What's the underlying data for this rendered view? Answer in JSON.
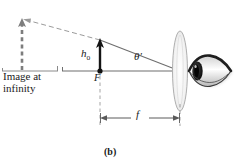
{
  "figure": {
    "part_label": "(b)",
    "labels": {
      "image_line1": "Image at",
      "image_line2": "infinity",
      "object_height": "h",
      "object_height_sub": "o",
      "focal_point": "F",
      "angle": "θ′",
      "focal_length": "f"
    },
    "colors": {
      "ink": "#1a1a1a",
      "ray": "#6e6e6e",
      "dashed": "#8a8a8a",
      "lens": "#b5b5b5",
      "eye_dark": "#2b2b2b",
      "background": "#ffffff"
    },
    "geometry": {
      "axis_y": 71,
      "axis_x_start": 62,
      "axis_x_end": 180,
      "object_x": 100,
      "object_top_y": 40,
      "lens_x": 180,
      "lens_ry": 40,
      "lens_rx": 7,
      "virtual_object_x": 22,
      "virtual_object_top_y": 19,
      "focal_dim_y": 118
    },
    "icons": {
      "eye": "eye-icon",
      "lens": "converging-lens-icon",
      "object_arrow": "object-arrow-icon",
      "virtual_arrow": "virtual-image-arrow-icon"
    }
  }
}
